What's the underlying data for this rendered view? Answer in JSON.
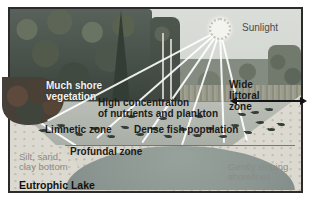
{
  "figure": {
    "title": "Eutrophic Lake",
    "labels": {
      "sunlight": "Sunlight",
      "much_shore": [
        "Much shore",
        "vegetation"
      ],
      "high_concentration": [
        "High concentration",
        "of nutrients and plankton"
      ],
      "wide_littoral": [
        "Wide",
        "littoral",
        "zone"
      ],
      "limnetic": "Limnetic zone",
      "dense_fish": "Dense fish population",
      "profundal": "Profundal zone",
      "substrate": [
        "Silt, sand,",
        "clay bottom"
      ],
      "shoreline": [
        "Gently sloping",
        "shorelines"
      ]
    }
  },
  "colors": {
    "label_dark": "#1b1b1b",
    "label_gray": "#8b8b87",
    "label_white": "#f2f2ee",
    "sky": "#d7dad5",
    "forest": "#4a544a",
    "water_band": "#b2b8b0",
    "profundal_water": "#8a9591",
    "sand": "#dbd8cf"
  },
  "scene": {
    "sun": {
      "x": 210,
      "y": 20,
      "r": 11
    },
    "rays": [
      [
        37,
        111
      ],
      [
        87,
        128
      ],
      [
        132,
        133
      ],
      [
        172,
        135
      ],
      [
        214,
        133
      ],
      [
        237,
        131
      ]
    ],
    "littoral_arrow": {
      "x1": 226,
      "x2": 291,
      "y": 91
    },
    "fish": [
      [
        30,
        120
      ],
      [
        48,
        115
      ],
      [
        66,
        124
      ],
      [
        82,
        118
      ],
      [
        98,
        126
      ],
      [
        112,
        117
      ],
      [
        127,
        124
      ],
      [
        141,
        118
      ],
      [
        155,
        126
      ],
      [
        170,
        119
      ],
      [
        184,
        125
      ],
      [
        197,
        118
      ],
      [
        210,
        126
      ],
      [
        222,
        115
      ],
      [
        235,
        122
      ],
      [
        247,
        112
      ],
      [
        258,
        119
      ],
      [
        268,
        114
      ],
      [
        150,
        108
      ],
      [
        118,
        106
      ],
      [
        186,
        106
      ],
      [
        242,
        102
      ],
      [
        256,
        99
      ],
      [
        229,
        104
      ]
    ]
  }
}
